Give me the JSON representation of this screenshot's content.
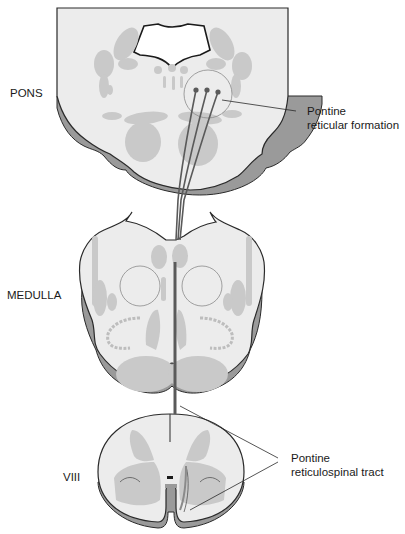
{
  "diagram": {
    "type": "neuroanatomy cross-section diagram",
    "sections": [
      {
        "id": "pons",
        "label": "PONS"
      },
      {
        "id": "medulla",
        "label": "MEDULLA"
      },
      {
        "id": "spinal_cord",
        "label": "VIII"
      }
    ],
    "callouts": [
      {
        "id": "pontine_reticular_formation",
        "lines": [
          "Pontine",
          "reticular formation"
        ]
      },
      {
        "id": "pontine_reticulospinal_tract",
        "lines": [
          "Pontine",
          "reticulospinal tract"
        ]
      }
    ],
    "colors": {
      "tissue_fill": "#ececec",
      "nucleus_fill": "#c9c9c9",
      "outline": "#2a2a2a",
      "rim_shadow": "#9a9a9a",
      "tract": "#5a5a5a"
    }
  }
}
